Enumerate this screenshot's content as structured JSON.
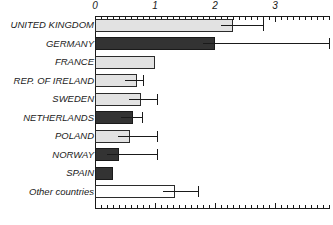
{
  "chart_data": {
    "type": "bar",
    "orientation": "horizontal",
    "title": "",
    "xlabel": "",
    "ylabel": "",
    "xlim": [
      0,
      3.9
    ],
    "grid": false,
    "legend": null,
    "x_ticks_major": [
      0,
      1,
      2,
      3
    ],
    "x_tick_labels": [
      "0",
      "1",
      "2",
      "3"
    ],
    "x_tick_minor_step": 0.1,
    "categories": [
      "UNITED KINGDOM",
      "GERMANY",
      "FRANCE",
      "REP. OF IRELAND",
      "SWEDEN",
      "NETHERLANDS",
      "POLAND",
      "NORWAY",
      "SPAIN",
      "Other countries"
    ],
    "values": [
      2.3,
      2.0,
      1.0,
      0.7,
      0.77,
      0.63,
      0.58,
      0.4,
      0.3,
      1.33
    ],
    "error_high": [
      2.8,
      3.9,
      null,
      0.8,
      1.03,
      0.78,
      1.03,
      1.03,
      null,
      1.72
    ],
    "bar_fill": [
      "light-gray",
      "dark-gray",
      "light-gray",
      "light-gray",
      "light-gray",
      "dark-gray",
      "light-gray",
      "dark-gray",
      "dark-gray",
      "white"
    ],
    "colors": {
      "light-gray": "#e2e2e2",
      "dark-gray": "#333333",
      "white": "#ffffff",
      "outline": "#2b2b2b",
      "axis": "#1a1a1a",
      "background": "#ffffff"
    }
  }
}
